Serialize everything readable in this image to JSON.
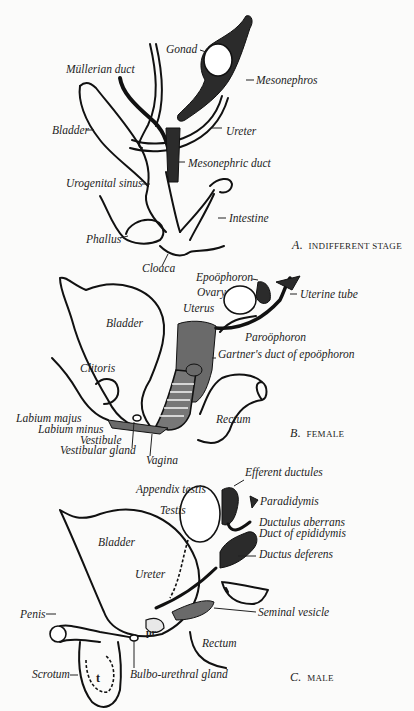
{
  "figure": {
    "panels": [
      {
        "id": "A",
        "caption_letter": "A.",
        "caption_text": "INDIFFERENT STAGE",
        "labels": [
          "Gonad",
          "Müllerian duct",
          "Mesonephros",
          "Bladder",
          "Ureter",
          "Mesonephric duct",
          "Urogenital sinus",
          "Intestine",
          "Phallus",
          "Cloaca"
        ]
      },
      {
        "id": "B",
        "caption_letter": "B.",
        "caption_text": "FEMALE",
        "labels": [
          "Epoöphoron",
          "Ovary",
          "Uterine tube",
          "Uterus",
          "Bladder",
          "Paroöphoron",
          "Gartner's duct of epoöphoron",
          "Clitoris",
          "Labium majus",
          "Labium minus",
          "Vestibule",
          "Vestibular gland",
          "Rectum",
          "Vagina"
        ]
      },
      {
        "id": "C",
        "caption_letter": "C.",
        "caption_text": "MALE",
        "labels": [
          "Efferent ductules",
          "Appendix testis",
          "Paradidymis",
          "Testis",
          "Ductulus aberrans",
          "Duct of epididymis",
          "Bladder",
          "Ductus deferens",
          "Ureter",
          "Penis",
          "Seminal vesicle",
          "Rectum",
          "Scrotum",
          "Bulbo-urethral gland"
        ],
        "inline_marks": [
          "pr",
          "t"
        ]
      }
    ]
  }
}
